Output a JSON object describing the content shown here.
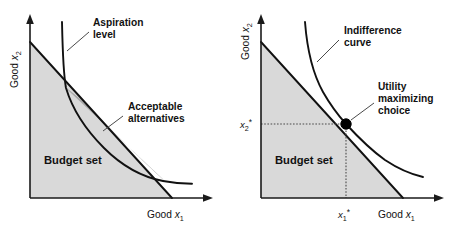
{
  "figure": {
    "panel_count": 2,
    "colors": {
      "budget_set_fill": "#d9d9d9",
      "acceptable_region_fill": "#a9a9a9",
      "line": "#111111",
      "leader": "#4a4a4a",
      "background": "#ffffff"
    }
  },
  "panels": [
    {
      "id": "left",
      "name": "aspiration-level-panel",
      "axes": {
        "x_label_prefix": "Good ",
        "x_label_var": "x",
        "x_label_sub": "1",
        "y_label_prefix": "Good ",
        "y_label_var": "x",
        "y_label_sub": "2"
      },
      "annotations": [
        {
          "name": "aspiration-level",
          "line1": "Aspiration",
          "line2": "level"
        },
        {
          "name": "acceptable-alternatives",
          "line1": "Acceptable",
          "line2": "alternatives"
        }
      ],
      "regions": [
        {
          "name": "budget-set",
          "label": "Budget set"
        },
        {
          "name": "acceptable-alternatives-region",
          "label": ""
        }
      ]
    },
    {
      "id": "right",
      "name": "utility-maximizing-panel",
      "axes": {
        "x_label_prefix": "Good ",
        "x_label_var": "x",
        "x_label_sub": "1",
        "y_label_prefix": "Good ",
        "y_label_var": "x",
        "y_label_sub": "2"
      },
      "annotations": [
        {
          "name": "indifference-curve",
          "line1": "Indifference",
          "line2": "curve"
        },
        {
          "name": "utility-maximizing-choice",
          "line1": "Utility",
          "line2": "maximizing",
          "line3": "choice"
        }
      ],
      "regions": [
        {
          "name": "budget-set",
          "label": "Budget set"
        }
      ],
      "ticks": {
        "x_star_var": "x",
        "x_star_sub": "1",
        "x_star_mark": "*",
        "y_star_var": "x",
        "y_star_sub": "2",
        "y_star_mark": "*"
      }
    }
  ]
}
